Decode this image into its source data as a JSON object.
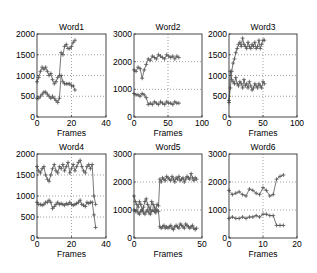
{
  "figure": {
    "background": "#ffffff",
    "line_color": "#555555",
    "marker": "plus",
    "grid": "dotted"
  },
  "chart_data": [
    {
      "type": "line",
      "title": "Word1",
      "xlabel": "Frames",
      "ylabel": "",
      "xlim": [
        0,
        40
      ],
      "ylim": [
        0,
        2000
      ],
      "xticks": [
        0,
        20,
        40
      ],
      "yticks": [
        0,
        500,
        1000,
        1500,
        2000
      ],
      "grid": true,
      "series": [
        {
          "name": "upper",
          "x": [
            0,
            1,
            2,
            3,
            4,
            5,
            6,
            7,
            8,
            9,
            10,
            11,
            12,
            13,
            14,
            15,
            16,
            17,
            18,
            19,
            20,
            21,
            22
          ],
          "values": [
            850,
            950,
            1100,
            1200,
            1150,
            1200,
            1100,
            1000,
            1050,
            900,
            800,
            850,
            950,
            1000,
            1550,
            1500,
            1700,
            1750,
            1650,
            1650,
            1700,
            1800,
            1850
          ]
        },
        {
          "name": "lower",
          "x": [
            0,
            1,
            2,
            3,
            4,
            5,
            6,
            7,
            8,
            9,
            10,
            11,
            12,
            13,
            14,
            15,
            16,
            17,
            18,
            19,
            20,
            21,
            22
          ],
          "values": [
            450,
            450,
            500,
            550,
            600,
            600,
            550,
            500,
            450,
            500,
            450,
            400,
            350,
            450,
            1000,
            850,
            800,
            800,
            800,
            800,
            750,
            750,
            650
          ]
        }
      ]
    },
    {
      "type": "line",
      "title": "Word2",
      "xlabel": "Frames",
      "ylabel": "",
      "xlim": [
        0,
        100
      ],
      "ylim": [
        0,
        3000
      ],
      "xticks": [
        0,
        50,
        100
      ],
      "yticks": [
        0,
        1000,
        2000,
        3000
      ],
      "grid": true,
      "series": [
        {
          "name": "upper",
          "x": [
            0,
            3,
            6,
            9,
            12,
            15,
            18,
            21,
            24,
            27,
            30,
            33,
            36,
            39,
            42,
            45,
            48,
            51,
            54,
            57,
            60,
            63,
            66
          ],
          "values": [
            1700,
            1650,
            1800,
            1750,
            1400,
            1700,
            1900,
            2100,
            2050,
            2200,
            2150,
            2100,
            2250,
            2200,
            2150,
            2100,
            2250,
            2200,
            2150,
            2200,
            2100,
            2200,
            2150
          ]
        },
        {
          "name": "lower",
          "x": [
            0,
            3,
            6,
            9,
            12,
            15,
            18,
            21,
            24,
            27,
            30,
            33,
            36,
            39,
            42,
            45,
            48,
            51,
            54,
            57,
            60,
            63,
            66
          ],
          "values": [
            850,
            800,
            800,
            750,
            850,
            800,
            700,
            450,
            500,
            450,
            550,
            500,
            450,
            550,
            500,
            450,
            550,
            500,
            500,
            450,
            550,
            500,
            500
          ]
        }
      ]
    },
    {
      "type": "line",
      "title": "Word3",
      "xlabel": "Frames",
      "ylabel": "",
      "xlim": [
        0,
        100
      ],
      "ylim": [
        0,
        2000
      ],
      "xticks": [
        0,
        50,
        100
      ],
      "yticks": [
        0,
        500,
        1000,
        1500,
        2000
      ],
      "grid": true,
      "series": [
        {
          "name": "upper",
          "x": [
            0,
            2,
            4,
            6,
            8,
            10,
            12,
            14,
            16,
            18,
            20,
            22,
            24,
            26,
            28,
            30,
            32,
            34,
            36,
            38,
            40,
            42,
            44,
            46,
            48,
            50,
            52
          ],
          "values": [
            400,
            700,
            1100,
            1300,
            1400,
            1550,
            1650,
            1750,
            1800,
            1700,
            1900,
            1750,
            1700,
            1650,
            1800,
            1700,
            1650,
            1750,
            1700,
            1800,
            1650,
            1700,
            1850,
            1650,
            1750,
            1850,
            1850
          ]
        },
        {
          "name": "lower",
          "x": [
            0,
            2,
            4,
            6,
            8,
            10,
            12,
            14,
            16,
            18,
            20,
            22,
            24,
            26,
            28,
            30,
            32,
            34,
            36,
            38,
            40,
            42,
            44,
            46,
            48,
            50,
            52
          ],
          "values": [
            350,
            1100,
            900,
            850,
            800,
            950,
            800,
            750,
            850,
            800,
            700,
            900,
            750,
            800,
            700,
            850,
            750,
            650,
            700,
            800,
            750,
            700,
            800,
            750,
            700,
            850,
            800
          ]
        }
      ]
    },
    {
      "type": "line",
      "title": "Word4",
      "xlabel": "Frames",
      "ylabel": "",
      "xlim": [
        0,
        40
      ],
      "ylim": [
        0,
        2000
      ],
      "xticks": [
        0,
        20,
        40
      ],
      "yticks": [
        0,
        500,
        1000,
        1500,
        2000
      ],
      "grid": true,
      "series": [
        {
          "name": "upper",
          "x": [
            0,
            1,
            2,
            3,
            4,
            5,
            6,
            7,
            8,
            9,
            10,
            11,
            12,
            13,
            14,
            15,
            16,
            17,
            18,
            19,
            20,
            21,
            22,
            23,
            24,
            25,
            26,
            27,
            28,
            29,
            30,
            31,
            32,
            33,
            34
          ],
          "values": [
            1700,
            1600,
            1550,
            1650,
            1700,
            1500,
            1400,
            1350,
            1500,
            1650,
            1750,
            1600,
            1550,
            1700,
            1650,
            1750,
            1600,
            1700,
            1800,
            1550,
            1650,
            1750,
            1600,
            1700,
            1800,
            1850,
            1700,
            1600,
            1550,
            1700,
            1750,
            1650,
            1750,
            1000,
            800
          ]
        },
        {
          "name": "lower",
          "x": [
            0,
            1,
            2,
            3,
            4,
            5,
            6,
            7,
            8,
            9,
            10,
            11,
            12,
            13,
            14,
            15,
            16,
            17,
            18,
            19,
            20,
            21,
            22,
            23,
            24,
            25,
            26,
            27,
            28,
            29,
            30,
            31,
            32,
            33,
            34
          ],
          "values": [
            850,
            800,
            800,
            780,
            800,
            850,
            850,
            900,
            850,
            700,
            750,
            800,
            850,
            800,
            820,
            800,
            780,
            820,
            800,
            850,
            800,
            780,
            800,
            820,
            850,
            900,
            800,
            780,
            750,
            850,
            820,
            850,
            850,
            550,
            250
          ]
        }
      ]
    },
    {
      "type": "line",
      "title": "Word5",
      "xlabel": "Frames",
      "ylabel": "",
      "xlim": [
        0,
        50
      ],
      "ylim": [
        0,
        3000
      ],
      "xticks": [
        0,
        50
      ],
      "yticks": [
        0,
        1000,
        2000,
        3000
      ],
      "grid": true,
      "series": [
        {
          "name": "upper",
          "x": [
            0,
            1,
            2,
            3,
            4,
            5,
            6,
            7,
            8,
            9,
            10,
            11,
            12,
            13,
            14,
            15,
            16,
            17,
            18,
            19,
            20,
            21,
            22,
            23,
            24,
            25,
            26,
            27,
            28,
            29,
            30,
            31,
            32,
            33,
            34,
            35,
            36,
            37,
            38,
            39,
            40,
            41,
            42,
            43,
            44,
            45,
            46
          ],
          "values": [
            1500,
            1300,
            1200,
            1100,
            1300,
            1200,
            1000,
            1100,
            1300,
            1400,
            1200,
            1100,
            1000,
            1300,
            1200,
            1100,
            1000,
            1200,
            1150,
            2100,
            2000,
            2150,
            2100,
            2050,
            2200,
            2150,
            2100,
            2050,
            2200,
            2100,
            2000,
            2150,
            2100,
            2200,
            2050,
            2100,
            2150,
            2000,
            2100,
            2200,
            2150,
            2100,
            2300,
            2150,
            2050,
            2150,
            2100
          ]
        },
        {
          "name": "lower",
          "x": [
            0,
            1,
            2,
            3,
            4,
            5,
            6,
            7,
            8,
            9,
            10,
            11,
            12,
            13,
            14,
            15,
            16,
            17,
            18,
            19,
            20,
            21,
            22,
            23,
            24,
            25,
            26,
            27,
            28,
            29,
            30,
            31,
            32,
            33,
            34,
            35,
            36,
            37,
            38,
            39,
            40,
            41,
            42,
            43,
            44,
            45,
            46
          ],
          "values": [
            1000,
            950,
            1000,
            900,
            850,
            950,
            1000,
            900,
            850,
            950,
            1000,
            900,
            850,
            950,
            1000,
            950,
            900,
            1000,
            950,
            400,
            350,
            400,
            450,
            350,
            400,
            350,
            400,
            450,
            350,
            300,
            400,
            450,
            400,
            350,
            500,
            450,
            400,
            350,
            500,
            450,
            400,
            350,
            400,
            450,
            350,
            300,
            350
          ]
        }
      ]
    },
    {
      "type": "line",
      "title": "Word6",
      "xlabel": "Frames",
      "ylabel": "",
      "xlim": [
        0,
        20
      ],
      "ylim": [
        0,
        3000
      ],
      "xticks": [
        0,
        10,
        20
      ],
      "yticks": [
        0,
        1000,
        2000,
        3000
      ],
      "grid": true,
      "series": [
        {
          "name": "upper",
          "x": [
            0,
            1,
            2,
            3,
            4,
            5,
            6,
            7,
            8,
            9,
            10,
            11,
            12,
            13,
            14,
            15,
            16
          ],
          "values": [
            1700,
            1550,
            1600,
            1650,
            1550,
            1500,
            1750,
            1700,
            1600,
            1550,
            1800,
            1700,
            1500,
            1550,
            2100,
            2200,
            2250
          ]
        },
        {
          "name": "lower",
          "x": [
            0,
            1,
            2,
            3,
            4,
            5,
            6,
            7,
            8,
            9,
            10,
            11,
            12,
            13,
            14,
            15,
            16
          ],
          "values": [
            700,
            750,
            700,
            700,
            750,
            700,
            750,
            750,
            800,
            750,
            850,
            850,
            800,
            800,
            450,
            450,
            450
          ]
        }
      ]
    }
  ]
}
